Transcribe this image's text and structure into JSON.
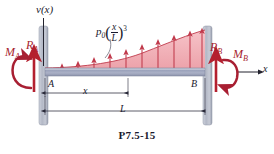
{
  "figure": {
    "caption": "P7.5-15",
    "deflection_axis_label": "v(x)",
    "horizontal_axis_label": "x",
    "node_labels": {
      "left": "A",
      "right": "B"
    },
    "dimensions": {
      "partial": "x",
      "total": "L"
    },
    "load": {
      "symbol": "p",
      "symbol_subscript": "0",
      "fraction_numerator": "x",
      "fraction_denominator": "L",
      "exponent": "3"
    },
    "reactions": [
      {
        "name": "R_A",
        "base": "R",
        "subscript": "A",
        "type": "force"
      },
      {
        "name": "M_A",
        "base": "M",
        "subscript": "A",
        "type": "moment"
      },
      {
        "name": "R_B",
        "base": "R",
        "subscript": "B",
        "type": "force"
      },
      {
        "name": "M_B",
        "base": "M",
        "subscript": "B",
        "type": "moment"
      }
    ],
    "colors": {
      "load_fill": "#f0aeb4",
      "load_arrow": "#c0394b",
      "reaction_red": "#b4202f",
      "moment_red": "#a81f32",
      "beam_fill": "#a8afc6",
      "wall_fill": "#b9bdca",
      "axis_dark": "#23232f",
      "text": "#1a1a2e"
    },
    "geometry": {
      "beam_left_x": 45,
      "beam_right_x": 205,
      "beam_top_y": 68,
      "beam_bottom_y": 76,
      "load_peak_y": 30,
      "x_dim_end": 128,
      "load_arrow_count": 10
    }
  }
}
